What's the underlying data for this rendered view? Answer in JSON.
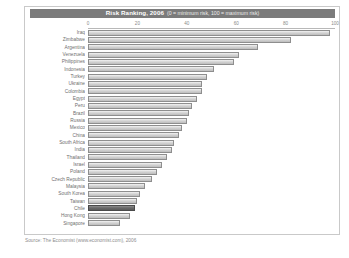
{
  "chart_data": {
    "type": "bar",
    "orientation": "horizontal",
    "title": "Risk Ranking, 2006",
    "subtitle": "(0 = minimum risk, 100 = maximum risk)",
    "xlabel": "",
    "ylabel": "",
    "xlim": [
      0,
      100
    ],
    "xticks": [
      "0",
      "20",
      "40",
      "60",
      "80",
      "100"
    ],
    "grid": false,
    "legend": null,
    "highlight_category": "Chile",
    "categories": [
      "Iraq",
      "Zimbabwe",
      "Argentina",
      "Venezuela",
      "Philippines",
      "Indonesia",
      "Turkey",
      "Ukraine",
      "Colombia",
      "Egypt",
      "Peru",
      "Brazil",
      "Russia",
      "Mexico",
      "China",
      "South Africa",
      "India",
      "Thailand",
      "Israel",
      "Poland",
      "Czech Republic",
      "Malaysia",
      "South Korea",
      "Taiwan",
      "Chile",
      "Hong Kong",
      "Singapore"
    ],
    "values": [
      98,
      82,
      69,
      61,
      59,
      51,
      48,
      46,
      46,
      44,
      42,
      41,
      40,
      38,
      37,
      35,
      34,
      32,
      30,
      28,
      26,
      23,
      21,
      20,
      19,
      17,
      13
    ],
    "source": "Source: The Economist (www.economist.com), 2006"
  },
  "figure": {
    "colors": {
      "title_bar": "#7b7b7b",
      "bar_fill": "#d4d4d4",
      "bar_border": "#8e8e8e",
      "highlight_fill": "#6b6b6b",
      "frame": "#c9c9c9",
      "text": "#6f6f6f"
    }
  }
}
